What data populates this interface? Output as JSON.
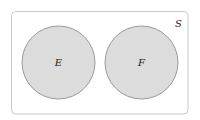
{
  "diagram": {
    "type": "venn",
    "title": "",
    "universe": {
      "label": "S",
      "x": 11.5,
      "y": 11.5,
      "width": 176.5,
      "height": 102.5,
      "corner_radius": 4,
      "stroke": "#c8c8c8",
      "fill": "#ffffff"
    },
    "sets": [
      {
        "label": "E",
        "cx": 58.5,
        "cy": 62.5,
        "r": 36.5,
        "fill": "#dcdcdc",
        "stroke": "#9a9a9a"
      },
      {
        "label": "F",
        "cx": 141.5,
        "cy": 62.5,
        "r": 36.5,
        "fill": "#dcdcdc",
        "stroke": "#9a9a9a"
      }
    ],
    "relationship": "disjoint (mutually exclusive)"
  }
}
